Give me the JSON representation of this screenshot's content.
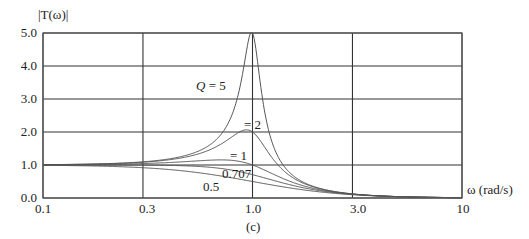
{
  "chart_data": {
    "type": "line",
    "title": "",
    "caption": "(c)",
    "ylabel": "|T(ω)|",
    "xlabel": "ω (rad/s)",
    "xscale": "log",
    "xlim": [
      0.1,
      10
    ],
    "ylim": [
      0.0,
      5.0
    ],
    "grid": true,
    "x_ticks": [
      0.1,
      0.3,
      1.0,
      3.0,
      10
    ],
    "x_tick_labels": [
      "0.1",
      "0.3",
      "1.0",
      "3.0",
      "10"
    ],
    "y_ticks": [
      0.0,
      1.0,
      2.0,
      3.0,
      4.0,
      5.0
    ],
    "y_tick_labels": [
      "0.0",
      "1.0",
      "2.0",
      "3.0",
      "4.0",
      "5.0"
    ],
    "model": "|T(ω)| = 1 / sqrt((1 − ω²)² + (ω/Q)²)",
    "x": [
      0.1,
      0.3,
      0.5,
      0.7,
      0.9,
      1.0,
      1.2,
      1.5,
      2.0,
      3.0,
      5.0,
      10
    ],
    "series": [
      {
        "name": "Q = 5",
        "Q": 5,
        "label": "Q = 5",
        "values": [
          1.01,
          1.09,
          1.33,
          1.92,
          4.07,
          5.0,
          1.99,
          0.78,
          0.33,
          0.12,
          0.04,
          0.01
        ]
      },
      {
        "name": "Q = 2",
        "Q": 2,
        "label": "= 2",
        "values": [
          1.01,
          1.09,
          1.28,
          1.62,
          2.05,
          2.0,
          1.28,
          0.69,
          0.32,
          0.12,
          0.04,
          0.01
        ]
      },
      {
        "name": "Q = 1",
        "Q": 1,
        "label": "= 1",
        "values": [
          1.0,
          1.06,
          1.15,
          1.18,
          1.11,
          1.0,
          0.71,
          0.43,
          0.28,
          0.12,
          0.04,
          0.01
        ]
      },
      {
        "name": "Q = 0.707",
        "Q": 0.707,
        "label": "0.707",
        "values": [
          1.0,
          1.0,
          0.97,
          0.9,
          0.78,
          0.71,
          0.57,
          0.41,
          0.24,
          0.11,
          0.04,
          0.01
        ]
      },
      {
        "name": "Q = 0.5",
        "Q": 0.5,
        "label": "0.5",
        "values": [
          0.99,
          0.92,
          0.8,
          0.67,
          0.55,
          0.5,
          0.41,
          0.31,
          0.2,
          0.1,
          0.04,
          0.01
        ]
      }
    ],
    "colors": {
      "grid": "#333333",
      "curve": "#555555",
      "text": "#222222"
    }
  }
}
